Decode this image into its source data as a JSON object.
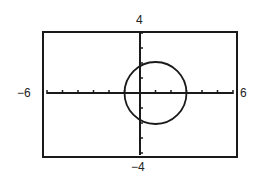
{
  "window": {
    "xmin": -6,
    "xmax": 6,
    "ymin": -4,
    "ymax": 4,
    "xscl": 1,
    "yscl": 1
  },
  "labels": {
    "ymax": "4",
    "ymin": "−4",
    "xmin": "−6",
    "xmax": "6"
  },
  "colors": {
    "frame": "#1a1a1a",
    "axes": "#1a1a1a",
    "curve": "#1a1a1a",
    "background": "#ffffff"
  },
  "chart_data": {
    "type": "line",
    "title": "",
    "xlabel": "",
    "ylabel": "",
    "xlim": [
      -6,
      6
    ],
    "ylim": [
      -4,
      4
    ],
    "grid": false,
    "legend": null,
    "tick_labels": {
      "x": [
        "−6",
        "6"
      ],
      "y": [
        "−4",
        "4"
      ]
    },
    "x_ticks": [
      -5,
      -4,
      -3,
      -2,
      -1,
      1,
      2,
      3,
      4,
      5
    ],
    "y_ticks": [
      -3,
      -2,
      -1,
      1,
      2,
      3
    ],
    "series": [
      {
        "name": "circle",
        "equation": "(x - 1)^2 + y^2 = 4",
        "center": [
          1,
          0
        ],
        "radius": 2,
        "points": [
          [
            3,
            0
          ],
          [
            2.73,
            1
          ],
          [
            2,
            1.73
          ],
          [
            1,
            2
          ],
          [
            0,
            1.73
          ],
          [
            -0.73,
            1
          ],
          [
            -1,
            0
          ],
          [
            -0.73,
            -1
          ],
          [
            0,
            -1.73
          ],
          [
            1,
            -2
          ],
          [
            2,
            -1.73
          ],
          [
            2.73,
            -1
          ],
          [
            3,
            0
          ]
        ]
      }
    ]
  }
}
